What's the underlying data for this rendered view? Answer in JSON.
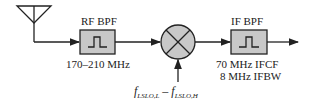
{
  "diagram": {
    "type": "superheterodyne receiver front-end block diagram",
    "blocks": [
      {
        "id": "antenna",
        "label": ""
      },
      {
        "id": "rf_bpf",
        "label": "RF BPF",
        "caption": "170–210 MHz"
      },
      {
        "id": "mixer",
        "label": ""
      },
      {
        "id": "if_bpf",
        "label": "IF BPF",
        "caption_line1": "70 MHz IFCF",
        "caption_line2": "8 MHz IFBW"
      }
    ],
    "lo_input": {
      "label": "f_LSLO,L – f_LSLO,H",
      "part1": "f",
      "sub1": "LSLO,L",
      "dash": " – ",
      "part2": "f",
      "sub2": "LSLO,H"
    },
    "colors": {
      "block_fill": "#c8c8c8",
      "stroke": "#222222",
      "background": "#ffffff"
    }
  }
}
